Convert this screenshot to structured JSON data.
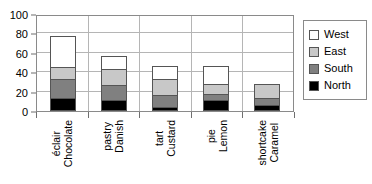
{
  "chart_data": {
    "type": "bar",
    "subtype": "stacked-column",
    "title": "",
    "xlabel": "",
    "ylabel": "",
    "ylim": [
      0,
      100
    ],
    "yticks": [
      0,
      20,
      40,
      60,
      80,
      100
    ],
    "grid": true,
    "legend_position": "right",
    "categories": [
      "Chocolate éclair",
      "Danish pastry",
      "Custard tart",
      "Lemon pie",
      "Caramel shortcake"
    ],
    "category_lines": [
      [
        "Chocolate",
        "éclair"
      ],
      [
        "Danish",
        "pastry"
      ],
      [
        "Custard",
        "tart"
      ],
      [
        "Lemon",
        "pie"
      ],
      [
        "Caramel",
        "shortcake"
      ]
    ],
    "series": [
      {
        "name": "North",
        "color": "#000000",
        "values": [
          13,
          11,
          4,
          11,
          6
        ]
      },
      {
        "name": "South",
        "color": "#808080",
        "values": [
          21,
          17,
          14,
          8,
          8
        ]
      },
      {
        "name": "East",
        "color": "#c8c8c8",
        "values": [
          13,
          17,
          17,
          11,
          16
        ]
      },
      {
        "name": "West",
        "color": "#ffffff",
        "values": [
          33,
          15,
          15,
          20,
          0
        ]
      }
    ],
    "totals": [
      80,
      60,
      50,
      50,
      30
    ],
    "stack_order_bottom_to_top": [
      "North",
      "South",
      "East",
      "West"
    ]
  },
  "legend": {
    "entries": [
      {
        "label": "West",
        "swatch": "#ffffff"
      },
      {
        "label": "East",
        "swatch": "#c8c8c8"
      },
      {
        "label": "South",
        "swatch": "#808080"
      },
      {
        "label": "North",
        "swatch": "#000000"
      }
    ]
  },
  "axis": {
    "y_tick_labels": [
      "100",
      "80",
      "60",
      "40",
      "20",
      "0"
    ]
  },
  "title_remnant": {
    "text": ""
  }
}
